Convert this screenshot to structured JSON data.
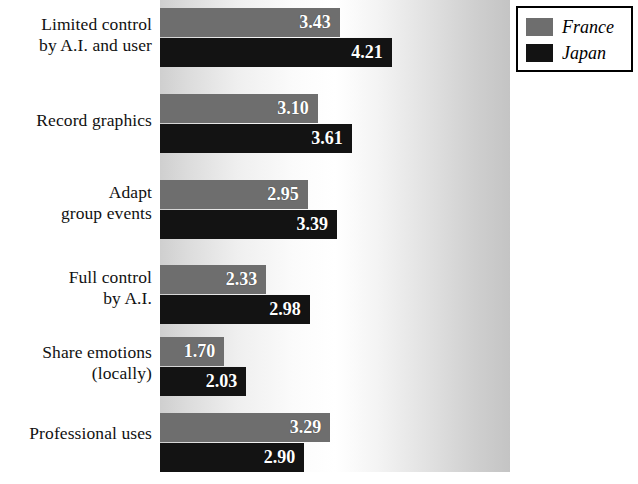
{
  "chart_data": {
    "type": "bar",
    "orientation": "horizontal",
    "title": "",
    "xlabel": "",
    "ylabel": "",
    "grid": false,
    "legend_position": "top-right",
    "xlim": [
      0,
      5
    ],
    "categories": [
      "Limited control by A.I. and user",
      "Record graphics",
      "Adapt group events",
      "Full control by A.I.",
      "Share emotions (locally)",
      "Professional uses"
    ],
    "category_lines": [
      [
        "Limited control",
        "by A.I. and user"
      ],
      [
        "Record graphics",
        ""
      ],
      [
        "Adapt",
        "group events"
      ],
      [
        "Full control",
        "by A.I."
      ],
      [
        "Share emotions",
        "(locally)"
      ],
      [
        "Professional uses",
        ""
      ]
    ],
    "series": [
      {
        "name": "France",
        "color": "#6e6e6e",
        "values": [
          3.43,
          3.1,
          2.95,
          2.33,
          1.7,
          3.29
        ],
        "labels": [
          "3.43",
          "3.10",
          "2.95",
          "2.33",
          "1.70",
          "3.29"
        ]
      },
      {
        "name": "Japan",
        "color": "#131313",
        "values": [
          4.21,
          3.61,
          3.39,
          2.98,
          2.03,
          2.9
        ],
        "labels": [
          "4.21",
          "3.61",
          "3.39",
          "2.98",
          "2.03",
          "2.90"
        ]
      }
    ]
  },
  "legend": {
    "entries": [
      {
        "label": "France",
        "color": "#6e6e6e"
      },
      {
        "label": "Japan",
        "color": "#131313"
      }
    ]
  },
  "colors": {
    "france": "#6e6e6e",
    "japan": "#131313",
    "value_text": "#ffffff",
    "label_text": "#111111",
    "legend_border": "#000000"
  }
}
